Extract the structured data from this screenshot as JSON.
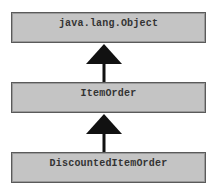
{
  "diagram": {
    "type": "class-inheritance",
    "nodes": [
      {
        "id": "object",
        "label": "java.lang.Object"
      },
      {
        "id": "itemorder",
        "label": "ItemOrder"
      },
      {
        "id": "discounted",
        "label": "DiscountedItemOrder"
      }
    ],
    "edges": [
      {
        "from": "itemorder",
        "to": "object",
        "kind": "inheritance-arrow"
      },
      {
        "from": "discounted",
        "to": "itemorder",
        "kind": "inheritance-arrow"
      }
    ],
    "colors": {
      "box_fill": "#c4c4c4",
      "box_border": "#5a5a5a",
      "arrow": "#111111",
      "background": "#ffffff"
    }
  }
}
